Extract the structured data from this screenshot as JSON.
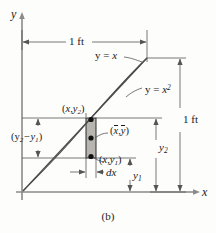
{
  "figure": {
    "caption": "(b)",
    "axes": {
      "y_label": "y",
      "x_label": "x"
    },
    "curves": [
      {
        "name": "line",
        "label_main": "y = ",
        "label_var": "x",
        "equation": "y = x"
      },
      {
        "name": "parabola",
        "label_main": "y = ",
        "label_var": "x",
        "label_exp": "2",
        "equation": "y = x^2"
      }
    ],
    "dimensions": {
      "top_width": "1 ft",
      "right_height": "1 ft",
      "strip_width": "dx",
      "strip_height_main": "(y",
      "strip_height_sub1": "2",
      "strip_height_mid": "−y",
      "strip_height_sub2": "1",
      "strip_height_end": ")",
      "y1": "y",
      "y1_sub": "1",
      "y2": "y",
      "y2_sub": "2"
    },
    "points": {
      "top_open": "(",
      "top_x": "x,y",
      "top_sub": "2",
      "top_close": ")",
      "bot_x": "x,y",
      "bot_sub": "1",
      "centroid_open": "(",
      "centroid_xbar": "x",
      "centroid_comma": ",",
      "centroid_ybar": "y",
      "centroid_close": ")"
    },
    "colors": {
      "region_fill": "#d8d5d0",
      "strip_fill": "#b8b5b0",
      "axis": "#8a8a8a",
      "curve": "#4a4a4a",
      "dim": "#555555",
      "text": "#1a1a1a"
    }
  }
}
